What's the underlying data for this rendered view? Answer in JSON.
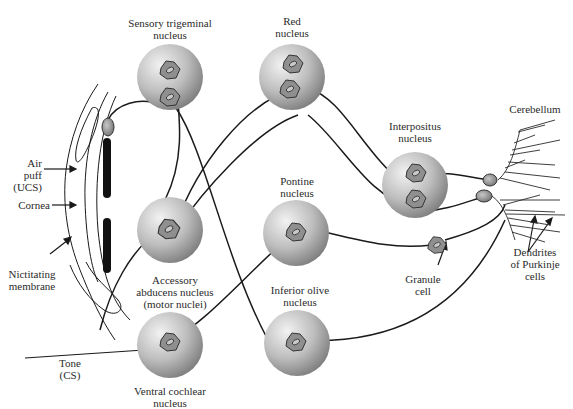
{
  "diagram": {
    "labels": {
      "sensory_trigeminal": [
        "Sensory trigeminal",
        "nucleus"
      ],
      "red_nucleus": [
        "Red",
        "nucleus"
      ],
      "interpositus": [
        "Interpositus",
        "nucleus"
      ],
      "cerebellum": "Cerebellum",
      "pontine": [
        "Pontine",
        "nucleus"
      ],
      "accessory_abducens": [
        "Accessory",
        "abducens nucleus",
        "(motor nuclei)"
      ],
      "inferior_olive": [
        "Inferior olive",
        "nucleus"
      ],
      "ventral_cochlear": [
        "Ventral cochlear",
        "nucleus"
      ],
      "granule_cell": [
        "Granule",
        "cell"
      ],
      "dendrites": [
        "Dendrites",
        "of Purkinje",
        "cells"
      ],
      "air_puff": [
        "Air",
        "puff",
        "(UCS)"
      ],
      "cornea": "Cornea",
      "nictitating": [
        "Nictitating",
        "membrane"
      ],
      "tone": [
        "Tone",
        "(CS)"
      ]
    },
    "colors": {
      "nucleus_light": "#e6e6e6",
      "nucleus_dark": "#8a8a8a",
      "neuron_fill": "#9a9a9a",
      "line": "#1a1a1a"
    }
  }
}
